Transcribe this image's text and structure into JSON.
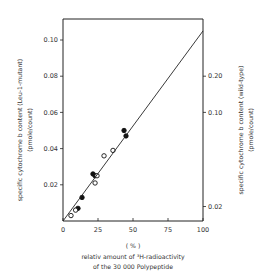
{
  "chart_data": {
    "type": "scatter",
    "title": "",
    "xlabel": "relativ amount of ³H-radioactivity of the 30 000 Polypeptide",
    "xlabel_lines": [
      "( % )",
      "relativ amount of ³H-radioactivity",
      "of the 30 000 Polypeptide"
    ],
    "ylabel_left": "specific cytochrome b content (Leu-1-mutant) (pmole/count)",
    "ylabel_left_lines": [
      "specific cytochrome b content (Leu-1-mutant)",
      "(pmole/count)"
    ],
    "ylabel_right": "specific cytochrome b content (wild-type) (pmole/count)",
    "ylabel_right_lines": [
      "specific cytochrome b content (wild-type)",
      "(pmole/count)"
    ],
    "xlim": [
      0,
      100
    ],
    "ylim_left": [
      0,
      0.11
    ],
    "x_ticks": [
      "0",
      "25",
      "50",
      "75",
      "100"
    ],
    "x_tick_values": [
      0,
      25,
      50,
      75,
      100
    ],
    "y_ticks_left": [
      "0.02",
      "0.04",
      "0.06",
      "0.08",
      "0.10"
    ],
    "y_tick_values_left": [
      0.02,
      0.04,
      0.06,
      0.08,
      0.1
    ],
    "y_ticks_right": [
      "0.02",
      "0.10",
      "0.20"
    ],
    "y_tick_positions_right_on_left_scale": [
      0.008,
      0.06,
      0.08
    ],
    "grid": false,
    "legend": null,
    "series": [
      {
        "name": "Leu-1-mutant (filled circles)",
        "marker": "filled-circle",
        "x": [
          10.7,
          13.6,
          21.4,
          22.9,
          43.6,
          45.0
        ],
        "y": [
          0.007,
          0.013,
          0.026,
          0.025,
          0.05,
          0.047
        ]
      },
      {
        "name": "wild-type (open circles)",
        "marker": "open-circle",
        "x": [
          5.7,
          9.0,
          24.3,
          22.9,
          29.3,
          35.7
        ],
        "y": [
          0.003,
          0.006,
          0.025,
          0.021,
          0.036,
          0.039
        ]
      },
      {
        "name": "regression line",
        "marker": "line",
        "x": [
          0,
          100
        ],
        "y": [
          0,
          0.105
        ]
      }
    ]
  }
}
